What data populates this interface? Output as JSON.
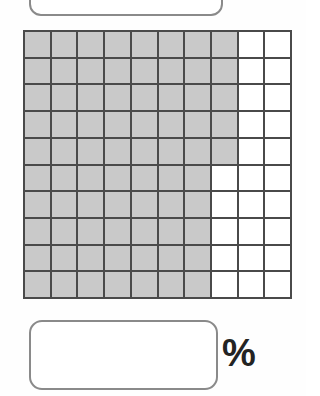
{
  "page": {
    "type": "percent-grid-worksheet",
    "background_color": "#fefefe"
  },
  "top_answer_box": {
    "name": "top-answer-box",
    "value": "",
    "placeholder": "",
    "border_color": "#8a8a8a",
    "fill_color": "#ffffff"
  },
  "grid": {
    "rows": 10,
    "columns": 10,
    "total_cells": 100,
    "shaded_count": 75,
    "unshaded_count": 25,
    "shaded_color": "#c9c9c9",
    "unshaded_color": "#ffffff",
    "line_color": "#4a4a4a",
    "shaded_per_row": [
      8,
      8,
      8,
      8,
      8,
      7,
      7,
      7,
      7,
      7
    ],
    "cells": [
      [
        1,
        1,
        1,
        1,
        1,
        1,
        1,
        1,
        0,
        0
      ],
      [
        1,
        1,
        1,
        1,
        1,
        1,
        1,
        1,
        0,
        0
      ],
      [
        1,
        1,
        1,
        1,
        1,
        1,
        1,
        1,
        0,
        0
      ],
      [
        1,
        1,
        1,
        1,
        1,
        1,
        1,
        1,
        0,
        0
      ],
      [
        1,
        1,
        1,
        1,
        1,
        1,
        1,
        1,
        0,
        0
      ],
      [
        1,
        1,
        1,
        1,
        1,
        1,
        1,
        0,
        0,
        0
      ],
      [
        1,
        1,
        1,
        1,
        1,
        1,
        1,
        0,
        0,
        0
      ],
      [
        1,
        1,
        1,
        1,
        1,
        1,
        1,
        0,
        0,
        0
      ],
      [
        1,
        1,
        1,
        1,
        1,
        1,
        1,
        0,
        0,
        0
      ],
      [
        1,
        1,
        1,
        1,
        1,
        1,
        1,
        0,
        0,
        0
      ]
    ]
  },
  "bottom_answer_box": {
    "name": "bottom-answer-box",
    "value": "",
    "placeholder": "",
    "border_color": "#8a8a8a",
    "fill_color": "#ffffff"
  },
  "percent_sign": {
    "label": "%",
    "color": "#232323"
  }
}
